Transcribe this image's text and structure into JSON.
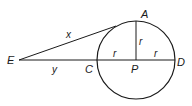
{
  "diagram": {
    "type": "geometry",
    "points": {
      "E": "E",
      "A": "A",
      "C": "C",
      "P": "P",
      "D": "D"
    },
    "segment_labels": {
      "tangent": "x",
      "external_secant": "y",
      "radius_vertical": "r",
      "radius_left": "r",
      "radius_right": "r"
    },
    "colors": {
      "stroke": "#1a1a1a",
      "background": "#ffffff"
    }
  }
}
